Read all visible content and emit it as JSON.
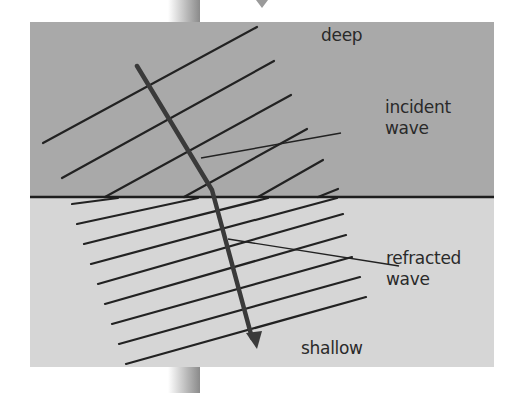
{
  "diagram": {
    "colors": {
      "deep_region": "#a9a9a9",
      "shallow_region": "#d6d6d6",
      "boundary": "#1e1e1e",
      "wavefront": "#222222",
      "ray": "#3a3a3a",
      "text": "#2a2a2a"
    },
    "regions": {
      "deep": {
        "label": "deep"
      },
      "shallow": {
        "label": "shallow"
      }
    },
    "annotations": {
      "incident": {
        "line1": "incident",
        "line2": "wave"
      },
      "refracted": {
        "line1": "refracted",
        "line2": "wave"
      }
    },
    "incident_wavefronts": 6,
    "refracted_wavefronts": 9
  }
}
